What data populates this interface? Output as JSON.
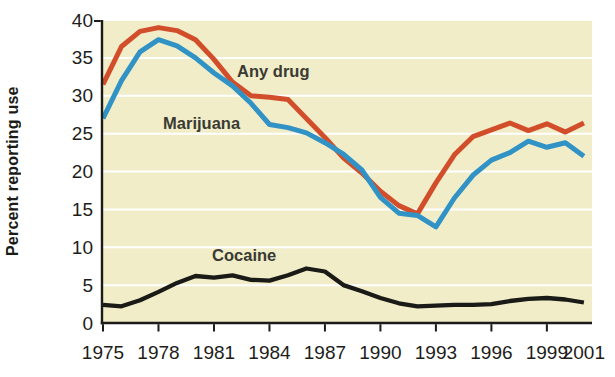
{
  "chart_data": {
    "type": "line",
    "title": "",
    "xlabel": "",
    "ylabel": "Percent reporting use",
    "x": [
      1975,
      1976,
      1977,
      1978,
      1979,
      1980,
      1981,
      1982,
      1983,
      1984,
      1985,
      1986,
      1987,
      1988,
      1989,
      1990,
      1991,
      1992,
      1993,
      1994,
      1995,
      1996,
      1997,
      1998,
      1999,
      2000,
      2001
    ],
    "series": [
      {
        "name": "Any drug",
        "color": "#d24e2b",
        "values": [
          31.5,
          36.5,
          38.5,
          39,
          38.6,
          37.4,
          34.8,
          31.8,
          30,
          29.8,
          29.5,
          27,
          24.5,
          21.8,
          19.8,
          17.4,
          15.5,
          14.4,
          18.5,
          22.2,
          24.6,
          25.5,
          26.4,
          25.4,
          26.3,
          25.2,
          26.4
        ]
      },
      {
        "name": "Marijuana",
        "color": "#3193c5",
        "values": [
          27,
          32,
          35.8,
          37.4,
          36.6,
          35,
          33,
          31.3,
          29,
          26.2,
          25.8,
          25.1,
          23.8,
          22.3,
          20.2,
          16.6,
          14.5,
          14.2,
          12.7,
          16.5,
          19.5,
          21.5,
          22.5,
          24,
          23.2,
          23.8,
          22
        ]
      },
      {
        "name": "Cocaine",
        "color": "#1a1a16",
        "values": [
          2.4,
          2.2,
          3,
          4.1,
          5.3,
          6.2,
          6,
          6.3,
          5.7,
          5.6,
          6.3,
          7.2,
          6.8,
          5,
          4.2,
          3.3,
          2.6,
          2.2,
          2.3,
          2.4,
          2.4,
          2.5,
          2.9,
          3.2,
          3.3,
          3.1,
          2.7
        ]
      }
    ],
    "annotations": [
      {
        "text": "Any drug",
        "x": 1982.25,
        "y": 32.5
      },
      {
        "text": "Marijuana",
        "x": 1978.25,
        "y": 25.6
      },
      {
        "text": "Cocaine",
        "x": 1980.9,
        "y": 8.2
      }
    ],
    "x_ticks": [
      {
        "label": "1975",
        "year": 1975,
        "has_tick": true
      },
      {
        "label": "1978",
        "year": 1978,
        "has_tick": true
      },
      {
        "label": "1981",
        "year": 1981,
        "has_tick": true
      },
      {
        "label": "1984",
        "year": 1984,
        "has_tick": true
      },
      {
        "label": "1987",
        "year": 1987,
        "has_tick": true
      },
      {
        "label": "1990",
        "year": 1990,
        "has_tick": true
      },
      {
        "label": "1993",
        "year": 1993,
        "has_tick": true
      },
      {
        "label": "1996",
        "year": 1996,
        "has_tick": true
      },
      {
        "label": "1999",
        "year": 1999,
        "has_tick": true
      },
      {
        "label": "2001",
        "year": 2001,
        "has_tick": false
      }
    ],
    "y_ticks": [
      0,
      5,
      10,
      15,
      20,
      25,
      30,
      35,
      40
    ],
    "xlim": [
      1975,
      2001
    ],
    "ylim": [
      0,
      40
    ],
    "grid": "horizontal",
    "legend_position": "inline-labels",
    "plot_bg": "#f1edc9",
    "grid_color": "#ffffff",
    "axis_color": "#1b1b18",
    "tick_label_color": "#1d1d1a",
    "annotation_color": "#3a3a33"
  }
}
